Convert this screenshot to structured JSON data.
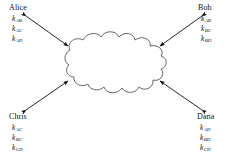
{
  "diagram": {
    "type": "key-distribution-network",
    "center_shape_label": "network-cloud",
    "parties": [
      {
        "id": "alice",
        "name": "Alice",
        "corner": "top-left",
        "keys": [
          {
            "symbol": "k",
            "subscript": "AB"
          },
          {
            "symbol": "k",
            "subscript": "AC"
          },
          {
            "symbol": "k",
            "subscript": "AD"
          }
        ]
      },
      {
        "id": "bob",
        "name": "Bob",
        "corner": "top-right",
        "keys": [
          {
            "symbol": "k",
            "subscript": "AB"
          },
          {
            "symbol": "k",
            "subscript": "BC"
          },
          {
            "symbol": "k",
            "subscript": "BD"
          }
        ]
      },
      {
        "id": "chris",
        "name": "Chris",
        "corner": "bottom-left",
        "keys": [
          {
            "symbol": "k",
            "subscript": "AC"
          },
          {
            "symbol": "k",
            "subscript": "BC"
          },
          {
            "symbol": "k",
            "subscript": "CD"
          }
        ]
      },
      {
        "id": "dana",
        "name": "Dana",
        "corner": "bottom-right",
        "keys": [
          {
            "symbol": "k",
            "subscript": "AD"
          },
          {
            "symbol": "k",
            "subscript": "BD"
          },
          {
            "symbol": "k",
            "subscript": "CD"
          }
        ]
      }
    ],
    "connectors": [
      {
        "id": "alice-cloud",
        "from": "alice",
        "to": "network-cloud",
        "style": "double-arrow"
      },
      {
        "id": "bob-cloud",
        "from": "bob",
        "to": "network-cloud",
        "style": "double-arrow"
      },
      {
        "id": "chris-cloud",
        "from": "chris",
        "to": "network-cloud",
        "style": "double-arrow"
      },
      {
        "id": "dana-cloud",
        "from": "dana",
        "to": "network-cloud",
        "style": "double-arrow"
      }
    ],
    "colors": {
      "background": "#ffffff",
      "stroke": "#4a4a4a",
      "arrow": "#000000",
      "text": "#111111"
    }
  }
}
